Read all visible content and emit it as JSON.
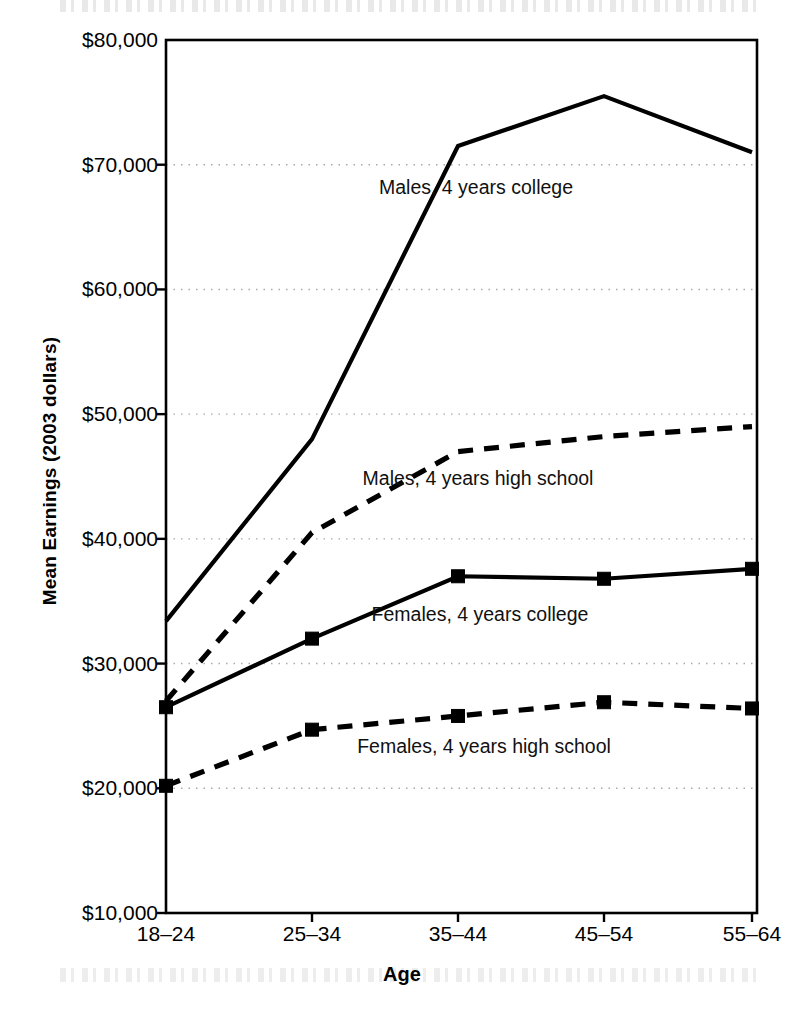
{
  "chart_data": {
    "type": "line",
    "title": "",
    "xlabel": "Age",
    "ylabel": "Mean Earnings (2003 dollars)",
    "categories": [
      "18–24",
      "25–34",
      "35–44",
      "45–54",
      "55–64"
    ],
    "ylim": [
      10000,
      80000
    ],
    "ytick_labels": [
      "$80,000",
      "$70,000",
      "$60,000",
      "$50,000",
      "$40,000",
      "$30,000",
      "$20,000",
      "$10,000"
    ],
    "ytick_values": [
      80000,
      70000,
      60000,
      50000,
      40000,
      30000,
      20000,
      10000
    ],
    "grid": true,
    "grid_style": "dotted",
    "grid_color": "#aaaaaa",
    "legend_position": "inline-annotations",
    "series": [
      {
        "name": "Males, 4 years college",
        "values": [
          33400,
          48000,
          71500,
          75500,
          71000
        ],
        "line_style": "solid",
        "marker": "none",
        "color": "#000000",
        "label_x": 476,
        "label_y": 178
      },
      {
        "name": "Males, 4 years high school",
        "values": [
          27000,
          40500,
          47000,
          48200,
          49000
        ],
        "line_style": "dashed",
        "marker": "none",
        "color": "#000000",
        "label_x": 478,
        "label_y": 469
      },
      {
        "name": "Females, 4 years college",
        "values": [
          26500,
          32000,
          37000,
          36800,
          37600
        ],
        "line_style": "solid",
        "marker": "square",
        "color": "#000000",
        "label_x": 480,
        "label_y": 605
      },
      {
        "name": "Females, 4 years high school",
        "values": [
          20200,
          24700,
          25800,
          26900,
          26400
        ],
        "line_style": "dashed",
        "marker": "square",
        "color": "#000000",
        "label_x": 484,
        "label_y": 737
      }
    ]
  },
  "axis": {
    "y_title": "Mean Earnings (2003 dollars)",
    "x_title": "Age"
  }
}
